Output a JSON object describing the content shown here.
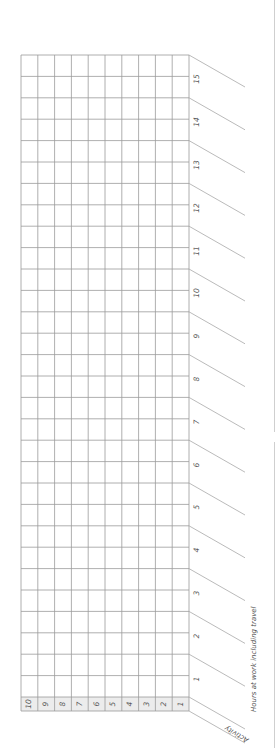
{
  "form": {
    "hours_axis_title": "Hours at work including travel",
    "activity_axis_title": "Activity",
    "hours": [
      "1",
      "2",
      "3",
      "4",
      "5",
      "6",
      "7",
      "8",
      "9",
      "10",
      "11",
      "12",
      "13",
      "14",
      "15"
    ],
    "activities": [
      "1",
      "2",
      "3",
      "4",
      "5",
      "6",
      "7",
      "8",
      "9",
      "10"
    ]
  },
  "colors": {
    "grid": "#9a9a9a",
    "header_fill": "#ececec",
    "text": "#555555"
  }
}
